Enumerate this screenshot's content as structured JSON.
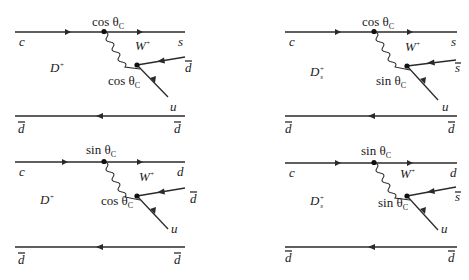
{
  "figure": {
    "colors": {
      "ink": "#2a2a2a",
      "background": "#ffffff"
    },
    "diagrams": [
      {
        "id": "top-left",
        "meson": "D",
        "meson_sup": "+",
        "meson_sub": "",
        "upper_in": "c",
        "upper_out": "s",
        "vertex1_factor": "cos θ",
        "vertex1_sub": "C",
        "boson": "W",
        "boson_sup": "+",
        "antiquark_in": "d",
        "antiquark_in_bar": true,
        "vertex2_factor": "cos θ",
        "vertex2_sub": "C",
        "quark_out": "u",
        "spectator_left": "d",
        "spectator_right": "d"
      },
      {
        "id": "top-right",
        "meson": "D",
        "meson_sup": "+",
        "meson_sub": "s",
        "upper_in": "c",
        "upper_out": "s",
        "vertex1_factor": "cos θ",
        "vertex1_sub": "C",
        "boson": "W",
        "boson_sup": "+",
        "antiquark_in": "s",
        "antiquark_in_bar": true,
        "vertex2_factor": "sin θ",
        "vertex2_sub": "C",
        "quark_out": "u",
        "spectator_left": "d",
        "spectator_right": "d"
      },
      {
        "id": "bottom-left",
        "meson": "D",
        "meson_sup": "+",
        "meson_sub": "",
        "upper_in": "c",
        "upper_out": "d",
        "vertex1_factor": "sin θ",
        "vertex1_sub": "C",
        "boson": "W",
        "boson_sup": "+",
        "antiquark_in": "d",
        "antiquark_in_bar": true,
        "vertex2_factor": "cos θ",
        "vertex2_sub": "C",
        "quark_out": "u",
        "spectator_left": "d",
        "spectator_right": "d"
      },
      {
        "id": "bottom-right",
        "meson": "D",
        "meson_sup": "+",
        "meson_sub": "s",
        "upper_in": "c",
        "upper_out": "d",
        "vertex1_factor": "sin θ",
        "vertex1_sub": "C",
        "boson": "W",
        "boson_sup": "+",
        "antiquark_in": "s",
        "antiquark_in_bar": true,
        "vertex2_factor": "sin θ",
        "vertex2_sub": "C",
        "quark_out": "u",
        "spectator_left": "d",
        "spectator_right": "d"
      }
    ]
  }
}
